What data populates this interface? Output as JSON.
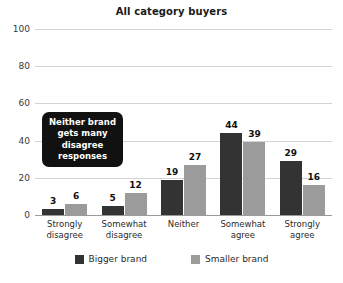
{
  "chart_data": {
    "type": "bar",
    "title": "All category buyers",
    "xlabel": "",
    "ylabel": "",
    "ylim": [
      0,
      100
    ],
    "yticks": [
      0,
      20,
      40,
      60,
      80,
      100
    ],
    "grid": true,
    "legend_position": "bottom",
    "categories": [
      "Strongly disagree",
      "Somewhat disagree",
      "Neither",
      "Somewhat agree",
      "Strongly agree"
    ],
    "category_lines": [
      [
        "Strongly",
        "disagree"
      ],
      [
        "Somewhat",
        "disagree"
      ],
      [
        "Neither",
        ""
      ],
      [
        "Somewhat",
        "agree"
      ],
      [
        "Strongly",
        "agree"
      ]
    ],
    "series": [
      {
        "name": "Bigger brand",
        "color": "#333333",
        "values": [
          3,
          5,
          19,
          44,
          29
        ]
      },
      {
        "name": "Smaller brand",
        "color": "#9b9b9b",
        "values": [
          6,
          12,
          27,
          39,
          16
        ]
      }
    ],
    "annotations": [
      {
        "text": "Neither brand gets many disagree responses",
        "style": "callout-box",
        "background": "#111111",
        "color": "#ffffff"
      }
    ]
  }
}
